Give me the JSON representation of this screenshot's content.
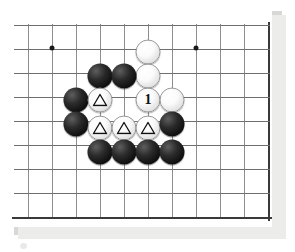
{
  "diagram": {
    "type": "go-board-diagram",
    "board": {
      "grid_spacing_px": 24,
      "origin_x_px": 28,
      "origin_y_px": 25,
      "columns": 11,
      "rows": 9,
      "line_color": "#8e8e8e",
      "border_color": "#3a3a3a",
      "background_color": "#ffffff"
    },
    "star_points": [
      {
        "name": "star-point-left",
        "x": 52,
        "y": 48
      },
      {
        "name": "star-point-right",
        "x": 196,
        "y": 48
      }
    ],
    "stones": [
      {
        "name": "white-stone",
        "color": "white",
        "x": 148,
        "y": 52,
        "mark": ""
      },
      {
        "name": "white-stone",
        "color": "white",
        "x": 148,
        "y": 76,
        "mark": ""
      },
      {
        "name": "black-stone",
        "color": "black",
        "x": 100,
        "y": 76,
        "mark": ""
      },
      {
        "name": "black-stone",
        "color": "black",
        "x": 124,
        "y": 76,
        "mark": ""
      },
      {
        "name": "black-stone",
        "color": "black",
        "x": 76,
        "y": 100,
        "mark": ""
      },
      {
        "name": "white-stone-triangle",
        "color": "white",
        "x": 100,
        "y": 100,
        "mark": "triangle"
      },
      {
        "name": "white-stone-move-1",
        "color": "white",
        "x": 148,
        "y": 100,
        "mark": "label",
        "label": "1"
      },
      {
        "name": "white-stone",
        "color": "white",
        "x": 172,
        "y": 100,
        "mark": ""
      },
      {
        "name": "black-stone",
        "color": "black",
        "x": 76,
        "y": 124,
        "mark": ""
      },
      {
        "name": "white-stone-triangle",
        "color": "white",
        "x": 100,
        "y": 128,
        "mark": "triangle"
      },
      {
        "name": "white-stone-triangle",
        "color": "white",
        "x": 124,
        "y": 128,
        "mark": "triangle"
      },
      {
        "name": "white-stone-triangle",
        "color": "white",
        "x": 148,
        "y": 128,
        "mark": "triangle"
      },
      {
        "name": "black-stone",
        "color": "black",
        "x": 172,
        "y": 124,
        "mark": ""
      },
      {
        "name": "black-stone",
        "color": "black",
        "x": 100,
        "y": 152,
        "mark": ""
      },
      {
        "name": "black-stone",
        "color": "black",
        "x": 124,
        "y": 152,
        "mark": ""
      },
      {
        "name": "black-stone",
        "color": "black",
        "x": 148,
        "y": 152,
        "mark": ""
      },
      {
        "name": "black-stone",
        "color": "black",
        "x": 172,
        "y": 152,
        "mark": ""
      }
    ],
    "move_labels": [
      "1"
    ],
    "colors": {
      "black_stone": "#101010",
      "white_stone": "#ffffff",
      "grid": "#8e8e8e",
      "border": "#3a3a3a",
      "star_point": "#1a1a1a"
    }
  }
}
